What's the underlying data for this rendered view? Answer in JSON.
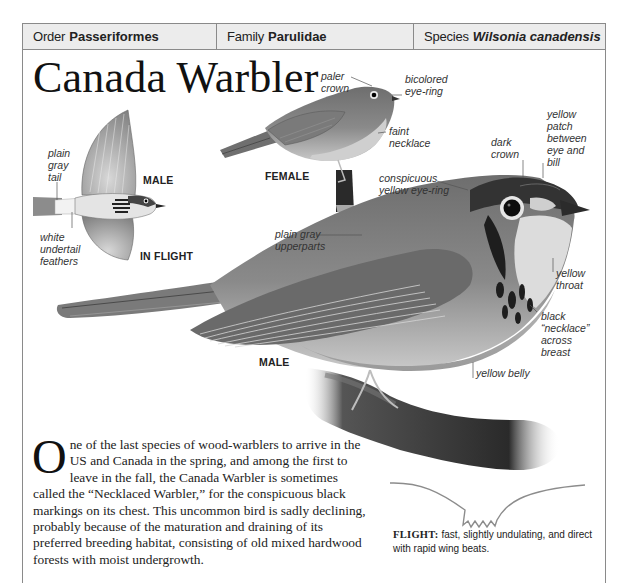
{
  "taxonomy": {
    "order": {
      "label": "Order",
      "value": "Passeriformes"
    },
    "family": {
      "label": "Family",
      "value": "Parulidae"
    },
    "species": {
      "label": "Species",
      "value": "Wilsonia canadensis"
    }
  },
  "title": "Canada Warbler",
  "illustrations": {
    "in_flight": {
      "captions": [
        "MALE",
        "IN FLIGHT"
      ],
      "labels": [
        "plain\ngray\ntail",
        "white\nundertail\nfeathers"
      ]
    },
    "female": {
      "caption": "FEMALE",
      "labels": [
        "paler\ncrown",
        "bicolored\neye-ring",
        "faint\nnecklace"
      ]
    },
    "male": {
      "caption": "MALE",
      "labels": [
        "yellow\npatch\nbetween\neye and\nbill",
        "dark\ncrown",
        "conspicuous\nyellow eye-ring",
        "plain gray\nupperparts",
        "yellow\nthroat",
        "black\n“necklace”\nacross\nbreast",
        "yellow belly"
      ]
    }
  },
  "description": {
    "drop_cap": "O",
    "text": "ne of the last species of wood-warblers to arrive in the US and Canada in the spring, and among the first to leave in the fall, the Canada Warbler is sometimes called the “Necklaced Warbler,” for the conspicuous black markings on its chest. This uncommon bird is sadly declining, probably because of the maturation and draining of its preferred breeding habitat, consisting of old mixed hardwood forests with moist undergrowth."
  },
  "flight": {
    "heading": "FLIGHT:",
    "text": " fast, slightly undulating, and direct with rapid wing beats."
  },
  "colors": {
    "frame": "#8a8a8a",
    "header_bg": "#ececec",
    "flight_path": "#8c8c8c"
  }
}
